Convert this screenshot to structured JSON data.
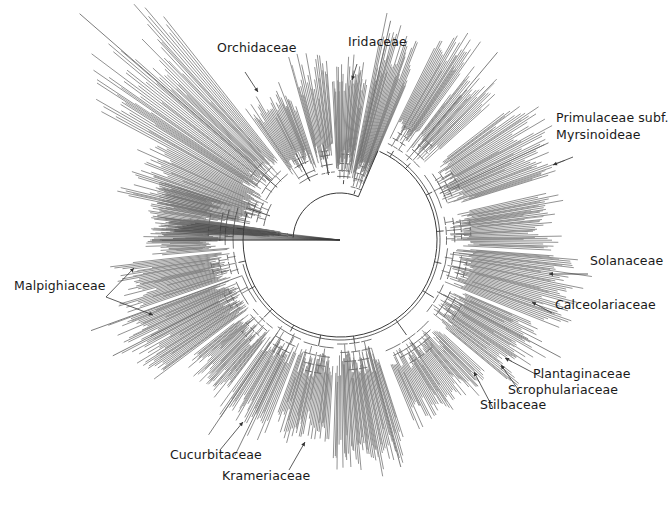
{
  "figure": {
    "type": "circular phylogenetic tree",
    "center": [
      340,
      240
    ],
    "colors": {
      "branch": "#6e6e6e",
      "backbone": "#3a3a3a",
      "label": "#1a1a1a",
      "arrow": "#333333",
      "background": "#ffffff"
    }
  },
  "labels": [
    {
      "id": "orchidaceae",
      "text": "Orchidaceae",
      "x": 217,
      "y": 52,
      "arrow": [
        [
          245,
          72
        ],
        [
          258,
          92
        ]
      ]
    },
    {
      "id": "iridaceae",
      "text": "Iridaceae",
      "x": 348,
      "y": 46,
      "arrow": [
        [
          357,
          64
        ],
        [
          352,
          80
        ]
      ]
    },
    {
      "id": "primulaceae",
      "text": "Primulaceae subf.",
      "text2": "Myrsinoideae",
      "x": 556,
      "y": 121,
      "arrow": [
        [
          573,
          157
        ],
        [
          553,
          165
        ]
      ]
    },
    {
      "id": "solanaceae",
      "text": "Solanaceae",
      "x": 590,
      "y": 265,
      "arrow": [
        [
          588,
          274
        ],
        [
          549,
          274
        ]
      ]
    },
    {
      "id": "calceolariaceae",
      "text": "Calceolariaceae",
      "x": 555,
      "y": 309,
      "arrow": [
        [
          552,
          313
        ],
        [
          532,
          302
        ]
      ]
    },
    {
      "id": "plantaginaceae",
      "text": "Plantaginaceae",
      "x": 533,
      "y": 378,
      "arrow": [
        [
          543,
          378
        ],
        [
          505,
          358
        ]
      ]
    },
    {
      "id": "scrophulariaceae",
      "text": "Scrophulariaceae",
      "x": 508,
      "y": 394,
      "arrow": [
        [
          520,
          392
        ],
        [
          501,
          365
        ]
      ]
    },
    {
      "id": "stilbaceae",
      "text": "Stilbaceae",
      "x": 480,
      "y": 409,
      "arrow": [
        [
          493,
          408
        ],
        [
          474,
          372
        ]
      ]
    },
    {
      "id": "krameriaceae",
      "text": "Krameriaceae",
      "x": 222,
      "y": 480,
      "arrow": [
        [
          289,
          470
        ],
        [
          305,
          442
        ]
      ]
    },
    {
      "id": "cucurbitaceae",
      "text": "Cucurbitaceae",
      "x": 170,
      "y": 459,
      "arrow": [
        [
          220,
          450
        ],
        [
          243,
          422
        ]
      ]
    },
    {
      "id": "malpighiaceae",
      "text": "Malpighiaceae",
      "x": 14,
      "y": 290,
      "arrow": [
        [
          106,
          297
        ],
        [
          134,
          268
        ]
      ],
      "arrow2": [
        [
          106,
          297
        ],
        [
          153,
          315
        ]
      ]
    }
  ],
  "clades": [
    {
      "name": "basal-grade",
      "a0": 183,
      "a1": 188,
      "r0": 48,
      "r1": 195,
      "n": 30,
      "jitter": 0.35,
      "seed": 3
    },
    {
      "name": "monocot-left-a",
      "a0": 190,
      "a1": 208,
      "r0": 70,
      "r1": 235,
      "n": 34,
      "jitter": 0.35,
      "seed": 5
    },
    {
      "name": "monocot-left-b",
      "a0": 208,
      "a1": 232,
      "r0": 78,
      "r1": 320,
      "n": 42,
      "jitter": 0.45,
      "seed": 7
    },
    {
      "name": "orchidaceae",
      "a0": 234,
      "a1": 252,
      "r0": 62,
      "r1": 175,
      "n": 30,
      "jitter": 0.3,
      "seed": 11
    },
    {
      "name": "monocot-mid",
      "a0": 254,
      "a1": 266,
      "r0": 62,
      "r1": 200,
      "n": 18,
      "jitter": 0.35,
      "seed": 13
    },
    {
      "name": "iridaceae",
      "a0": 267,
      "a1": 280,
      "r0": 56,
      "r1": 190,
      "n": 24,
      "jitter": 0.35,
      "seed": 17
    },
    {
      "name": "commelinid",
      "a0": 281,
      "a1": 293,
      "r0": 48,
      "r1": 240,
      "n": 26,
      "jitter": 0.35,
      "seed": 19
    },
    {
      "name": "eudicot-top",
      "a0": 296,
      "a1": 306,
      "r0": 100,
      "r1": 250,
      "n": 22,
      "jitter": 0.35,
      "seed": 23
    },
    {
      "name": "asterid-top",
      "a0": 307,
      "a1": 318,
      "r0": 100,
      "r1": 230,
      "n": 22,
      "jitter": 0.35,
      "seed": 29
    },
    {
      "name": "primulaceae",
      "a0": 322,
      "a1": 343,
      "r0": 100,
      "r1": 245,
      "n": 38,
      "jitter": 0.4,
      "seed": 31
    },
    {
      "name": "gentianales",
      "a0": 347,
      "a1": 363,
      "r0": 100,
      "r1": 230,
      "n": 30,
      "jitter": 0.4,
      "seed": 37
    },
    {
      "name": "solanaceae",
      "a0": 364,
      "a1": 382,
      "r0": 100,
      "r1": 262,
      "n": 36,
      "jitter": 0.35,
      "seed": 41
    },
    {
      "name": "calceolariaceae",
      "a0": 383,
      "a1": 400,
      "r0": 106,
      "r1": 240,
      "n": 34,
      "jitter": 0.35,
      "seed": 43
    },
    {
      "name": "lamiales",
      "a0": 402,
      "a1": 428,
      "r0": 112,
      "r1": 210,
      "n": 48,
      "jitter": 0.45,
      "seed": 47
    },
    {
      "name": "rosid-bottom-right",
      "a0": 432,
      "a1": 452,
      "r0": 100,
      "r1": 245,
      "n": 40,
      "jitter": 0.45,
      "seed": 53
    },
    {
      "name": "rosid-bottom",
      "a0": 453,
      "a1": 470,
      "r0": 104,
      "r1": 215,
      "n": 34,
      "jitter": 0.4,
      "seed": 59
    },
    {
      "name": "krameriaceae",
      "a0": 471,
      "a1": 486,
      "r0": 100,
      "r1": 220,
      "n": 26,
      "jitter": 0.5,
      "seed": 61
    },
    {
      "name": "fabids",
      "a0": 487,
      "a1": 502,
      "r0": 104,
      "r1": 205,
      "n": 32,
      "jitter": 0.4,
      "seed": 67
    },
    {
      "name": "cucurbitaceae",
      "a0": 503,
      "a1": 520,
      "r0": 100,
      "r1": 250,
      "n": 40,
      "jitter": 0.5,
      "seed": 71
    },
    {
      "name": "malvids",
      "a0": 521,
      "a1": 534,
      "r0": 100,
      "r1": 235,
      "n": 30,
      "jitter": 0.45,
      "seed": 73
    },
    {
      "name": "malpighiaceae",
      "a0": 535,
      "a1": 558,
      "r0": 100,
      "r1": 200,
      "n": 48,
      "jitter": 0.25,
      "seed": 79
    }
  ],
  "backbone": {
    "inner_arc": {
      "r": 47,
      "a0": 183,
      "a1": 293
    },
    "outer_arc": {
      "r": 97,
      "a0": 294,
      "a1": 556
    },
    "root_line": {
      "from": [
        340,
        240
      ],
      "to": [
        152,
        240
      ]
    }
  },
  "long_branches": [
    {
      "a": 221,
      "r0": 90,
      "r1": 345
    },
    {
      "a": 283,
      "r0": 60,
      "r1": 225
    },
    {
      "a": 310,
      "r0": 104,
      "r1": 245
    },
    {
      "a": 335,
      "r0": 110,
      "r1": 230
    },
    {
      "a": 388,
      "r0": 110,
      "r1": 250
    },
    {
      "a": 435,
      "r0": 110,
      "r1": 235
    },
    {
      "a": 476,
      "r0": 104,
      "r1": 240
    },
    {
      "a": 484,
      "r0": 104,
      "r1": 235
    },
    {
      "a": 513,
      "r0": 104,
      "r1": 255
    },
    {
      "a": 520,
      "r0": 104,
      "r1": 265
    }
  ]
}
